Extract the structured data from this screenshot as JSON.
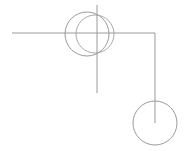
{
  "document": {
    "title": "Geometric Line Drawing",
    "width": 190,
    "height": 151,
    "background_color": "#ffffff"
  },
  "style": {
    "stroke_color": "#9a9a9a",
    "stroke_color_soft": "#a8a8a8",
    "stroke_width": 1
  },
  "figure": {
    "shapes": [
      {
        "id": "horizontal-rule",
        "name": "horizontal-line",
        "type": "line",
        "x1": 12,
        "y1": 33,
        "x2": 155,
        "y2": 33,
        "color": "#9a9a9a"
      },
      {
        "id": "vertical-rule",
        "name": "vertical-line",
        "type": "line",
        "x1": 97,
        "y1": 5,
        "x2": 97,
        "y2": 93,
        "color": "#9a9a9a"
      },
      {
        "id": "circle-left",
        "name": "overlapping-circle-left",
        "type": "circle",
        "cx": 87,
        "cy": 34,
        "r": 22,
        "color": "#9a9a9a"
      },
      {
        "id": "circle-right",
        "name": "overlapping-circle-right",
        "type": "circle",
        "cx": 95,
        "cy": 34,
        "r": 19,
        "color": "#a8a8a8"
      },
      {
        "id": "elbow-drop",
        "name": "right-angle-drop-line",
        "type": "line",
        "x1": 155,
        "y1": 33,
        "x2": 155,
        "y2": 123,
        "color": "#9a9a9a"
      },
      {
        "id": "circle-bottom",
        "name": "lower-right-circle",
        "type": "circle",
        "cx": 155,
        "cy": 123,
        "r": 22,
        "color": "#9a9a9a"
      }
    ]
  }
}
